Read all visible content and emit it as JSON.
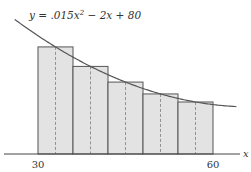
{
  "chart_data": {
    "type": "bar",
    "title": "",
    "function_label": "y = .015x² − 2x + 80",
    "function": {
      "a": 0.015,
      "b": -2,
      "c": 80
    },
    "xlabel": "x",
    "ylabel": "",
    "x_ticks": [
      30,
      60
    ],
    "xlim": [
      25.5,
      64.5
    ],
    "ylim": [
      0,
      44
    ],
    "grid": false,
    "legend": false,
    "annotation": "Midpoint Riemann sum, 5 subintervals of width 6",
    "rectangles": [
      {
        "x_left": 30,
        "x_right": 36,
        "midpoint": 33,
        "height": 30.335
      },
      {
        "x_left": 36,
        "x_right": 42,
        "midpoint": 39,
        "height": 24.815
      },
      {
        "x_left": 42,
        "x_right": 48,
        "midpoint": 45,
        "height": 20.375
      },
      {
        "x_left": 48,
        "x_right": 54,
        "midpoint": 51,
        "height": 17.015
      },
      {
        "x_left": 54,
        "x_right": 60,
        "midpoint": 57,
        "height": 14.735
      }
    ],
    "categories": [
      "33",
      "39",
      "45",
      "51",
      "57"
    ],
    "values": [
      30.335,
      24.815,
      20.375,
      17.015,
      14.735
    ],
    "colors": {
      "bar_fill": "#e3e3e3",
      "stroke": "#555555",
      "dash": "#888888"
    }
  },
  "labels": {
    "equation_prefix": "y = .015x",
    "equation_exp": "2",
    "equation_suffix": " − 2x + 80",
    "x_axis": "x",
    "tick_30": "30",
    "tick_60": "60"
  }
}
